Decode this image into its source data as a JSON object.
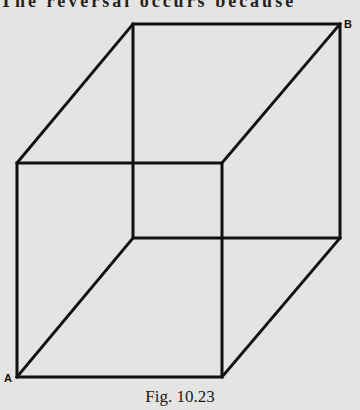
{
  "page": {
    "top_text": "The reversal occurs because"
  },
  "figure": {
    "caption": "Fig. 10.23",
    "labels": {
      "A": "A",
      "B": "B"
    },
    "line_color": "#111111",
    "front_face": {
      "x1": 17,
      "y1": 163,
      "x2": 222,
      "y2": 377
    },
    "back_face": {
      "x1": 133,
      "y1": 24,
      "x2": 340,
      "y2": 238
    }
  }
}
